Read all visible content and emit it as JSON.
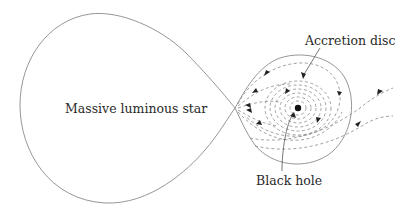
{
  "diagram": {
    "labels": {
      "star": "Massive luminous star",
      "accretion_disc": "Accretion disc",
      "black_hole": "Black hole"
    },
    "colors": {
      "outline": "#8a8a8a",
      "dashed": "#8a8a8a",
      "arrow": "#222222",
      "text": "#2a2a2a",
      "black_hole": "#111111"
    }
  }
}
